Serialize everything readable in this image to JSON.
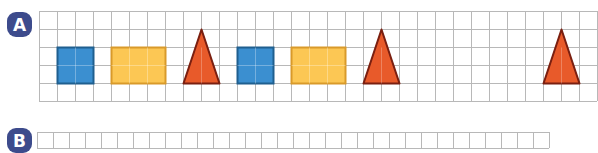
{
  "section_a": {
    "label": "A",
    "badge_color": "#3d4b8c",
    "grid": {
      "left": 39,
      "top": 11,
      "cell": 18,
      "cols": 31,
      "rows": 5,
      "line_color": "#b8b8b8"
    },
    "shapes": [
      {
        "type": "square",
        "col": 1,
        "row": 2,
        "w": 2,
        "h": 2,
        "fill": "#3b8fd0",
        "stroke": "#1f5f8f"
      },
      {
        "type": "rectangle",
        "col": 4,
        "row": 2,
        "w": 3,
        "h": 2,
        "fill": "#fcc754",
        "stroke": "#d99a2a"
      },
      {
        "type": "triangle",
        "col": 8,
        "row": 1,
        "w": 2,
        "h": 3,
        "fill": "#e85a2a",
        "stroke": "#7a1f10"
      },
      {
        "type": "square",
        "col": 11,
        "row": 2,
        "w": 2,
        "h": 2,
        "fill": "#3b8fd0",
        "stroke": "#1f5f8f"
      },
      {
        "type": "rectangle",
        "col": 14,
        "row": 2,
        "w": 3,
        "h": 2,
        "fill": "#fcc754",
        "stroke": "#d99a2a"
      },
      {
        "type": "triangle",
        "col": 18,
        "row": 1,
        "w": 2,
        "h": 3,
        "fill": "#e85a2a",
        "stroke": "#7a1f10"
      },
      {
        "type": "triangle",
        "col": 28,
        "row": 1,
        "w": 2,
        "h": 3,
        "fill": "#e85a2a",
        "stroke": "#7a1f10"
      }
    ]
  },
  "section_b": {
    "label": "B",
    "badge_color": "#3d4b8c",
    "grid": {
      "left": 37,
      "top": 132,
      "cell": 16,
      "cols": 32,
      "rows": 1,
      "line_color": "#b8b8b8"
    }
  }
}
